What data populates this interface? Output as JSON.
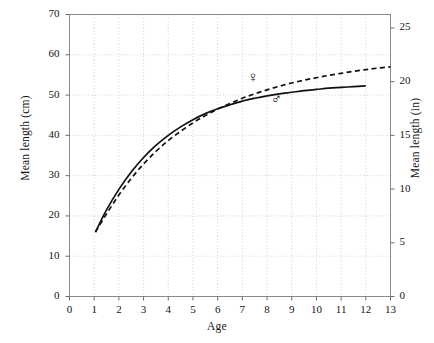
{
  "chart_data": {
    "type": "line",
    "title": "",
    "xlabel": "Age",
    "ylabel": "Mean length (cm)",
    "ylabel_secondary": "Mean length (in)",
    "xlim": [
      0,
      13
    ],
    "ylim": [
      0,
      70
    ],
    "ylim_secondary": [
      0,
      26.25
    ],
    "xticks": [
      0,
      1,
      2,
      3,
      4,
      5,
      6,
      7,
      8,
      9,
      10,
      11,
      12,
      13
    ],
    "xtick_labels": [
      "0",
      "1",
      "2",
      "3",
      "4",
      "5",
      "6",
      "7",
      "8",
      "9",
      "10",
      "11",
      "12",
      "13"
    ],
    "yticks": [
      0,
      10,
      20,
      30,
      40,
      50,
      60,
      70
    ],
    "ytick_labels": [
      "0",
      "10",
      "20",
      "30",
      "40",
      "50",
      "60",
      "70"
    ],
    "yticks_secondary": [
      0,
      5,
      10,
      15,
      20,
      25
    ],
    "ytick_labels_secondary": [
      "0",
      "5",
      "10",
      "15",
      "20",
      "25"
    ],
    "grid": true,
    "grid_style": "dotted",
    "grid_color": "#cfcfcf",
    "legend": "inline-symbols",
    "series": [
      {
        "name": "Female",
        "symbol": "♀",
        "style": "dashed",
        "color": "#111111",
        "label_x": 7.4,
        "label_y": 54.2,
        "x": [
          1.05,
          1.5,
          2.0,
          2.5,
          3.0,
          3.5,
          4.0,
          4.5,
          5.0,
          5.5,
          6.0,
          6.5,
          7.0,
          7.5,
          8.0,
          8.5,
          9.0,
          9.5,
          10.0,
          10.5,
          11.0,
          11.5,
          12.0,
          12.5,
          13.0
        ],
        "y": [
          16.0,
          20.5,
          25.2,
          29.3,
          32.9,
          36.0,
          38.7,
          41.0,
          43.1,
          44.9,
          46.5,
          47.9,
          49.2,
          50.3,
          51.3,
          52.2,
          53.0,
          53.7,
          54.3,
          54.9,
          55.4,
          55.9,
          56.3,
          56.7,
          57.0
        ]
      },
      {
        "name": "Male",
        "symbol": "♂",
        "style": "solid",
        "color": "#111111",
        "label_x": 8.35,
        "label_y": 48.9,
        "x": [
          1.05,
          1.5,
          2.0,
          2.5,
          3.0,
          3.5,
          4.0,
          4.5,
          5.0,
          5.5,
          6.0,
          6.5,
          7.0,
          7.5,
          8.0,
          8.5,
          9.0,
          9.5,
          10.0,
          10.5,
          11.0,
          11.5,
          12.0
        ],
        "y": [
          16.0,
          21.5,
          26.6,
          30.9,
          34.5,
          37.5,
          40.0,
          42.1,
          43.9,
          45.4,
          46.6,
          47.6,
          48.5,
          49.2,
          49.8,
          50.3,
          50.7,
          51.1,
          51.4,
          51.7,
          51.9,
          52.1,
          52.3
        ]
      }
    ]
  }
}
